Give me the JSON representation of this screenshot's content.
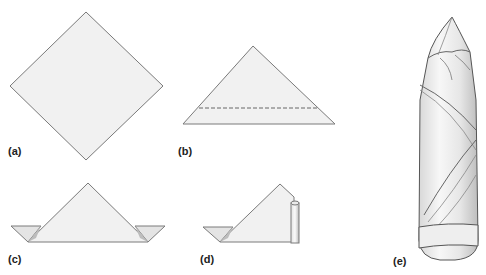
{
  "diagram": {
    "type": "napkin-folding-steps",
    "colors": {
      "paper_fill": "#f0f0f0",
      "outline": "#7a7a7a",
      "shadow": "#cfcfcf",
      "label": "#222222"
    },
    "steps": [
      {
        "id": "a",
        "label": "(a)",
        "description": "Square napkin laid flat as a diamond"
      },
      {
        "id": "b",
        "label": "(b)",
        "description": "Folded in half into a triangle, dashed line marks next fold"
      },
      {
        "id": "c",
        "label": "(c)",
        "description": "Bottom edge folded up, corners extending on both sides"
      },
      {
        "id": "d",
        "label": "(d)",
        "description": "Napkin being rolled from the right side"
      },
      {
        "id": "e",
        "label": "(e)",
        "description": "Finished rolled napkin standing upright"
      }
    ]
  }
}
